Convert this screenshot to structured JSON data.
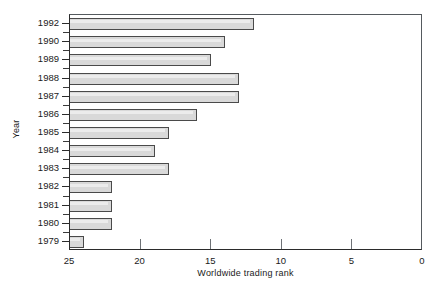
{
  "chart_data": {
    "type": "bar",
    "orientation": "horizontal",
    "title": "",
    "xlabel": "Worldwide trading rank",
    "ylabel": "Year",
    "categories": [
      "1992",
      "1990",
      "1989",
      "1988",
      "1987",
      "1986",
      "1985",
      "1984",
      "1983",
      "1982",
      "1981",
      "1980",
      "1979"
    ],
    "values": [
      12,
      14,
      15,
      13,
      13,
      16,
      18,
      19,
      18,
      22,
      22,
      22,
      24
    ],
    "xlim": [
      25,
      0
    ],
    "xticks": [
      25,
      20,
      15,
      10,
      5,
      0
    ],
    "xtick_labels": [
      "25",
      "20",
      "15",
      "10",
      "5",
      "0"
    ],
    "x_axis_reversed": true,
    "grid": false,
    "legend": "none",
    "bar_fill_color": "#d9d9d9",
    "bar_edge_color": "#4a4a4a",
    "axis_color": "#2b2b2b",
    "background_color": "#ffffff"
  }
}
